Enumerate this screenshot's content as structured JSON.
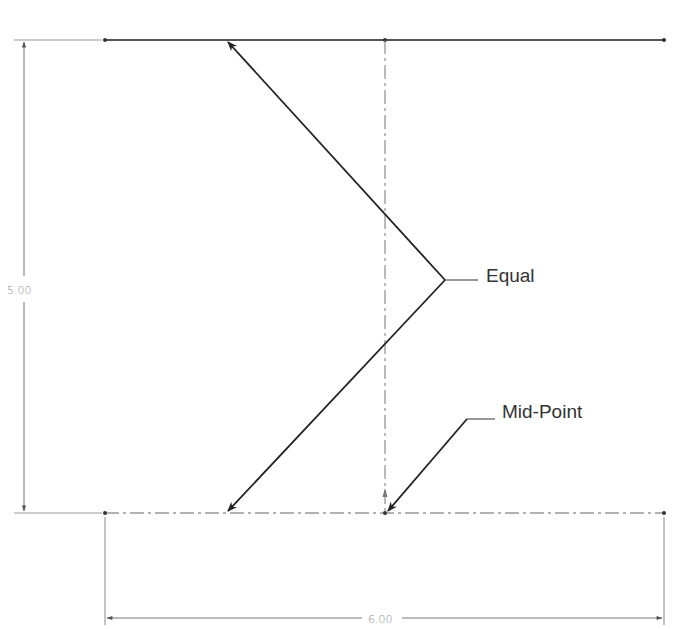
{
  "diagram": {
    "type": "sketch-drawing",
    "dimensions": {
      "vertical": {
        "value": "5.00"
      },
      "horizontal": {
        "value": "6.00"
      }
    },
    "annotations": {
      "equal": {
        "label": "Equal"
      },
      "midpoint": {
        "label": "Mid-Point"
      }
    },
    "colors": {
      "line": "#222222",
      "construction": "#777777",
      "dimension": "#8a8a8a"
    }
  }
}
